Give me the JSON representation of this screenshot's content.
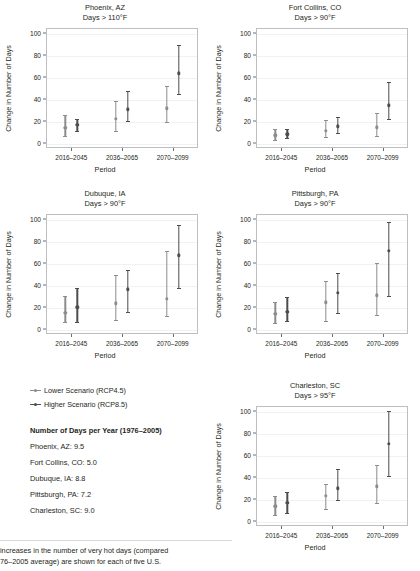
{
  "colors": {
    "lower": "#8c8c8c",
    "higher": "#4d4d4d",
    "axis": "#6d6e71",
    "grid": "#f1f1f2",
    "box": "#bcbec0"
  },
  "axis": {
    "ylabel": "Change in Number of Days",
    "xlabel": "Period",
    "yticks": [
      0,
      20,
      40,
      60,
      80,
      100
    ],
    "ylim": [
      -5,
      105
    ],
    "categories": [
      "2016–2045",
      "2036–2065",
      "2070–2099"
    ]
  },
  "legend": {
    "items": [
      {
        "label": "Lower Scenario (RCP4.5)",
        "color": "#8c8c8c"
      },
      {
        "label": "Higher Scenario (RCP8.5)",
        "color": "#4d4d4d"
      }
    ]
  },
  "info": {
    "heading": "Number of Days per Year (1976–2005)",
    "rows": [
      "Phoenix, AZ: 9.5",
      "Fort Collins, CO: 5.0",
      "Dubuque, IA: 8.8",
      "Pittsburgh, PA: 7.2",
      "Charleston, SC: 9.0"
    ]
  },
  "caption": {
    "line1": "increases in the number of very hot days (compared",
    "line2": "76–2005 average) are shown for each of five U.S."
  },
  "chart_data": [
    {
      "type": "scatter",
      "panel": "phoenix",
      "title": "Phoenix, AZ",
      "subtitle": "Days > 110°F",
      "xlabel": "Period",
      "ylabel": "Change in Number of Days",
      "ylim": [
        -5,
        105
      ],
      "grid": true,
      "categories": [
        "2016–2045",
        "2036–2065",
        "2070–2099"
      ],
      "series": [
        {
          "name": "Lower Scenario (RCP4.5)",
          "values": [
            13.5,
            22.0,
            31.5
          ],
          "lower": [
            6.0,
            11.0,
            19.0
          ],
          "upper": [
            25.5,
            38.0,
            51.5
          ]
        },
        {
          "name": "Higher Scenario (RCP8.5)",
          "values": [
            16.5,
            30.5,
            63.5
          ],
          "lower": [
            10.5,
            19.5,
            44.5
          ],
          "upper": [
            21.5,
            47.0,
            89.5
          ]
        }
      ]
    },
    {
      "type": "scatter",
      "panel": "fort-collins",
      "title": "Fort Collins, CO",
      "subtitle": "Days > 90°F",
      "xlabel": "Period",
      "ylabel": "Change in Number of Days",
      "ylim": [
        -5,
        105
      ],
      "grid": true,
      "categories": [
        "2016–2045",
        "2036–2065",
        "2070–2099"
      ],
      "series": [
        {
          "name": "Lower Scenario (RCP4.5)",
          "values": [
            6.5,
            11.0,
            14.0
          ],
          "lower": [
            2.5,
            5.5,
            6.0
          ],
          "upper": [
            12.5,
            21.0,
            27.0
          ]
        },
        {
          "name": "Higher Scenario (RCP8.5)",
          "values": [
            7.5,
            15.0,
            34.0
          ],
          "lower": [
            4.5,
            8.5,
            21.5
          ],
          "upper": [
            12.0,
            23.5,
            55.5
          ]
        }
      ]
    },
    {
      "type": "scatter",
      "panel": "dubuque",
      "title": "Dubuque, IA",
      "subtitle": "Days > 90°F",
      "xlabel": "Period",
      "ylabel": "Change in Number of Days",
      "ylim": [
        -5,
        105
      ],
      "grid": true,
      "categories": [
        "2016–2045",
        "2036–2065",
        "2070–2099"
      ],
      "series": [
        {
          "name": "Lower Scenario (RCP4.5)",
          "values": [
            14.5,
            23.0,
            27.5
          ],
          "lower": [
            6.0,
            7.5,
            11.5
          ],
          "upper": [
            30.0,
            49.5,
            71.0
          ]
        },
        {
          "name": "Higher Scenario (RCP8.5)",
          "values": [
            19.5,
            36.0,
            67.0
          ],
          "lower": [
            6.0,
            15.5,
            37.0
          ],
          "upper": [
            37.5,
            54.0,
            94.5
          ]
        }
      ]
    },
    {
      "type": "scatter",
      "panel": "pittsburgh",
      "title": "Pittsburgh, PA",
      "subtitle": "Days > 90°F",
      "xlabel": "Period",
      "ylabel": "Change in Number of Days",
      "ylim": [
        -5,
        105
      ],
      "grid": true,
      "categories": [
        "2016–2045",
        "2036–2065",
        "2070–2099"
      ],
      "series": [
        {
          "name": "Lower Scenario (RCP4.5)",
          "values": [
            13.5,
            24.0,
            30.5
          ],
          "lower": [
            5.0,
            6.5,
            12.0
          ],
          "upper": [
            24.5,
            44.0,
            60.0
          ]
        },
        {
          "name": "Higher Scenario (RCP8.5)",
          "values": [
            15.5,
            33.0,
            71.5
          ],
          "lower": [
            7.0,
            14.0,
            29.5
          ],
          "upper": [
            28.5,
            51.0,
            98.0
          ]
        }
      ]
    },
    {
      "type": "scatter",
      "panel": "charleston",
      "title": "Charleston, SC",
      "subtitle": "Days > 95°F",
      "xlabel": "Period",
      "ylabel": "Change in Number of Days",
      "ylim": [
        -5,
        105
      ],
      "grid": true,
      "categories": [
        "2016–2045",
        "2036–2065",
        "2070–2099"
      ],
      "series": [
        {
          "name": "Lower Scenario (RCP4.5)",
          "values": [
            13.0,
            22.5,
            31.5
          ],
          "lower": [
            5.5,
            11.0,
            16.0
          ],
          "upper": [
            22.5,
            33.5,
            51.0
          ]
        },
        {
          "name": "Higher Scenario (RCP8.5)",
          "values": [
            16.0,
            29.5,
            70.5
          ],
          "lower": [
            7.0,
            18.5,
            41.0
          ],
          "upper": [
            26.0,
            47.5,
            100.0
          ]
        }
      ]
    }
  ]
}
